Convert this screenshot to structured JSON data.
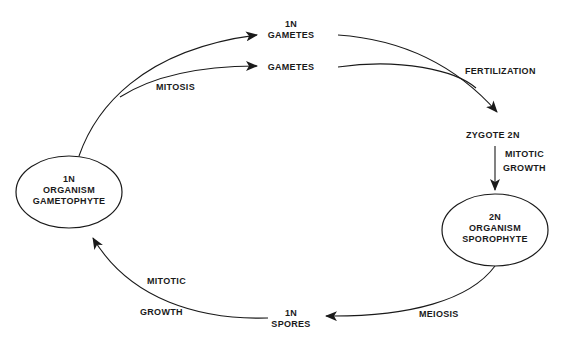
{
  "diagram": {
    "type": "life-cycle",
    "nodes": {
      "gametophyte": {
        "line1": "1N",
        "line2": "ORGANISM",
        "line3": "GAMETOPHYTE"
      },
      "sporophyte": {
        "line1": "2N",
        "line2": "ORGANISM",
        "line3": "SPOROPHYTE"
      },
      "gametes_top": {
        "line1": "1N",
        "line2": "GAMETES"
      },
      "gametes_bottom": {
        "line1": "GAMETES"
      },
      "zygote": {
        "label": "ZYGOTE 2N"
      },
      "spores": {
        "line1": "1N",
        "line2": "SPORES"
      }
    },
    "edges": {
      "mitosis": "MITOSIS",
      "fertilization": "FERTILIZATION",
      "mitotic_growth_top": {
        "line1": "MITOTIC",
        "line2": "GROWTH"
      },
      "meiosis": "MEIOSIS",
      "mitotic_growth_bottom": {
        "line1": "MITOTIC",
        "line2": "GROWTH"
      }
    },
    "colors": {
      "ink": "#1a1a1a",
      "background": "#ffffff"
    }
  }
}
